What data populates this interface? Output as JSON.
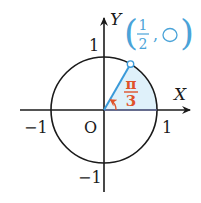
{
  "diagram": {
    "type": "unit-circle",
    "axes": {
      "x_label": "X",
      "y_label": "Y",
      "origin_label": "O"
    },
    "ticks": {
      "x_pos": "1",
      "x_neg": "−1",
      "y_pos": "1",
      "y_neg": "−1"
    },
    "point": {
      "x_numerator": "1",
      "x_denominator": "2",
      "separator": ",",
      "y_placeholder": "◯"
    },
    "angle": {
      "numerator": "π",
      "denominator": "3"
    },
    "colors": {
      "axis": "#1a1a1a",
      "ray": "#3a9ad9",
      "sector_fill": "#dff1fa",
      "angle": "#e0522a",
      "point_label": "#4aa3d8"
    }
  }
}
